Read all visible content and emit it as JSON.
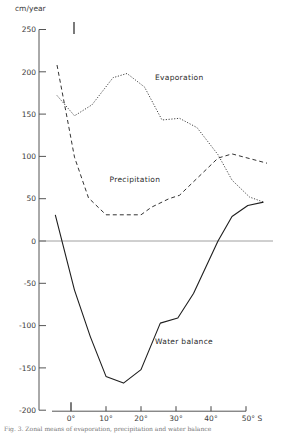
{
  "chart_data": {
    "type": "line",
    "title": "",
    "ylabel": "cm/year",
    "xlabel": "",
    "ylim": [
      -200,
      250
    ],
    "xlim": [
      -5,
      57
    ],
    "yticks": [
      250,
      200,
      150,
      100,
      50,
      0,
      -50,
      -100,
      -150,
      -200
    ],
    "ytick_labels": [
      "250",
      "200",
      "150",
      "100",
      "50",
      "0",
      "-50",
      "-100",
      "-150",
      "-200"
    ],
    "xticks": [
      0,
      10,
      20,
      30,
      40,
      50
    ],
    "xtick_labels": [
      "0°",
      "10°",
      "20°",
      "30°",
      "40°",
      "50° S"
    ],
    "grid": false,
    "zero_line": true,
    "legend": "inline labels",
    "series": [
      {
        "name": "Evaporation",
        "style": "dotted",
        "x": [
          -4,
          1,
          6,
          12,
          16,
          21,
          26,
          31,
          36,
          42,
          46,
          51,
          55
        ],
        "values": [
          172,
          148,
          161,
          193,
          198,
          182,
          143,
          145,
          134,
          102,
          72,
          52,
          46
        ]
      },
      {
        "name": "Precipitation",
        "style": "dashed",
        "x": [
          -4,
          -1,
          1,
          5,
          10,
          20,
          23,
          28,
          31,
          42,
          46,
          56
        ],
        "values": [
          208,
          143,
          99,
          51,
          31,
          31,
          40,
          50,
          54,
          98,
          103,
          92
        ]
      },
      {
        "name": "Water balance",
        "style": "solid",
        "x": [
          -4.5,
          1,
          5.5,
          10,
          15,
          20,
          25.5,
          30.5,
          35,
          42,
          46,
          50.5,
          55
        ],
        "values": [
          31,
          -58,
          -113,
          -160,
          -168,
          -152,
          -97,
          -91,
          -62,
          0,
          29,
          42,
          46
        ]
      }
    ],
    "annotations": [
      {
        "text": "Evaporation",
        "x": 24,
        "y": 190
      },
      {
        "text": "Precipitation",
        "x": 11,
        "y": 70
      },
      {
        "text": "Water balance",
        "x": 24,
        "y": -122
      }
    ]
  },
  "labels": {
    "y_unit": "cm/year",
    "evaporation": "Evaporation",
    "precipitation": "Precipitation",
    "water_balance": "Water balance",
    "caption": "Fig. 3. Zonal means of evaporation, precipitation and water balance"
  }
}
